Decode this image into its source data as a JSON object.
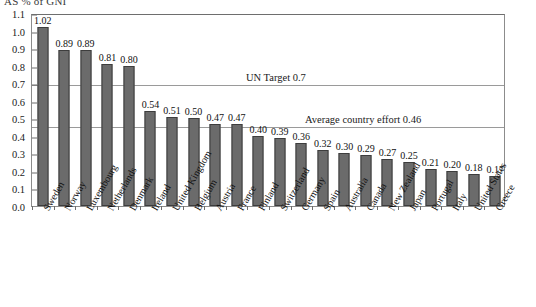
{
  "title": "AS % of GNI",
  "chart_data": {
    "type": "bar",
    "title": "AS % of GNI",
    "xlabel": "",
    "ylabel": "",
    "ylim": [
      0.0,
      1.1
    ],
    "ytick_step": 0.1,
    "grid": false,
    "legend": "none",
    "bar_color": "#6b6b6b",
    "bar_edge_color": "#3d3d3d",
    "categories": [
      "Sweden",
      "Norway",
      "Luxembourg",
      "Netherlands",
      "Denmark",
      "Ireland",
      "United Kingdom",
      "Belgium",
      "Austria",
      "France",
      "Finland",
      "Switzerland",
      "Germany",
      "Spain",
      "Australia",
      "Canada",
      "New Zealand",
      "Japan",
      "Portugal",
      "Italy",
      "United States",
      "Greece"
    ],
    "values": [
      1.02,
      0.89,
      0.89,
      0.81,
      0.8,
      0.54,
      0.51,
      0.5,
      0.47,
      0.47,
      0.4,
      0.39,
      0.36,
      0.32,
      0.3,
      0.29,
      0.27,
      0.25,
      0.21,
      0.2,
      0.18,
      0.17
    ],
    "value_labels": [
      "1.02",
      "0.89",
      "0.89",
      "0.81",
      "0.80",
      "0.54",
      "0.51",
      "0.50",
      "0.47",
      "0.47",
      "0.40",
      "0.39",
      "0.36",
      "0.32",
      "0.30",
      "0.29",
      "0.27",
      "0.25",
      "0.21",
      "0.20",
      "0.18",
      "0.17"
    ],
    "ytick_labels": [
      "0.0",
      "0.1",
      "0.2",
      "0.3",
      "0.4",
      "0.5",
      "0.6",
      "0.7",
      "0.8",
      "0.9",
      "1.0",
      "1.1"
    ],
    "ytick_values": [
      0.0,
      0.1,
      0.2,
      0.3,
      0.4,
      0.5,
      0.6,
      0.7,
      0.8,
      0.9,
      1.0,
      1.1
    ],
    "reference_lines": [
      {
        "label": "UN Target 0.7",
        "value": 0.7
      },
      {
        "label": "Average country effort 0.46",
        "value": 0.46
      }
    ]
  }
}
